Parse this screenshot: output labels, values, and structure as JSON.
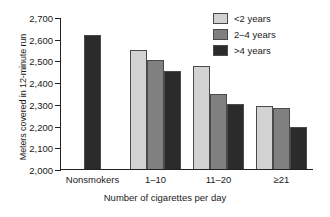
{
  "chart_data": {
    "type": "bar",
    "title": "",
    "xlabel": "Number of cigarettes per day",
    "ylabel": "Meters covered in 12-minute run",
    "categories": [
      "Nonsmokers",
      "1–10",
      "11–20",
      "≥21"
    ],
    "ylim": [
      2000,
      2700
    ],
    "ytick_labels": [
      "2,700",
      "2,600",
      "2,500",
      "2,400",
      "2,300",
      "2,200",
      "2,100",
      "2,000"
    ],
    "ytick_values": [
      2700,
      2600,
      2500,
      2400,
      2300,
      2200,
      2100,
      2000
    ],
    "grid": false,
    "legend_position": "top-right",
    "series": [
      {
        "name": "<2 years",
        "color": "#d2d2d2",
        "values": [
          null,
          2550,
          2475,
          2290
        ]
      },
      {
        "name": "2–4 years",
        "color": "#808080",
        "values": [
          null,
          2503,
          2345,
          2283
        ]
      },
      {
        "name": ">4 years",
        "color": "#2b2b2b",
        "values": [
          2615,
          2450,
          2300,
          2195
        ]
      }
    ]
  },
  "legend": {
    "items": [
      {
        "label": "<2 years"
      },
      {
        "label": "2–4 years"
      },
      {
        "label": ">4 years"
      }
    ]
  }
}
